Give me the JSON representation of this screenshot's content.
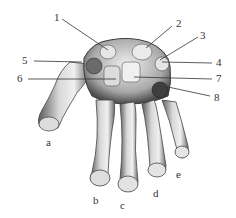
{
  "figure": {
    "number_labels": [
      {
        "id": "1",
        "x": 54,
        "y": 12,
        "lx1": 62,
        "ly1": 19,
        "lx2": 108,
        "ly2": 50
      },
      {
        "id": "2",
        "x": 176,
        "y": 18,
        "lx1": 172,
        "ly1": 26,
        "lx2": 146,
        "ly2": 48
      },
      {
        "id": "3",
        "x": 200,
        "y": 30,
        "lx1": 198,
        "ly1": 37,
        "lx2": 160,
        "ly2": 60
      },
      {
        "id": "4",
        "x": 216,
        "y": 57,
        "lx1": 212,
        "ly1": 63,
        "lx2": 162,
        "ly2": 62
      },
      {
        "id": "5",
        "x": 22,
        "y": 55,
        "lx1": 34,
        "ly1": 61,
        "lx2": 82,
        "ly2": 62
      },
      {
        "id": "6",
        "x": 17,
        "y": 73,
        "lx1": 28,
        "ly1": 79,
        "lx2": 116,
        "ly2": 79
      },
      {
        "id": "7",
        "x": 216,
        "y": 73,
        "lx1": 212,
        "ly1": 79,
        "lx2": 134,
        "ly2": 77
      },
      {
        "id": "8",
        "x": 214,
        "y": 92,
        "lx1": 210,
        "ly1": 96,
        "lx2": 168,
        "ly2": 87
      }
    ],
    "letter_labels": [
      {
        "id": "a",
        "x": 46,
        "y": 137
      },
      {
        "id": "b",
        "x": 93,
        "y": 195
      },
      {
        "id": "c",
        "x": 120,
        "y": 200
      },
      {
        "id": "d",
        "x": 153,
        "y": 188
      },
      {
        "id": "e",
        "x": 176,
        "y": 169
      }
    ],
    "colors": {
      "bone_light": "#e8e8e8",
      "bone_mid": "#b5b5b5",
      "bone_dark": "#4a4a4a",
      "line": "#333333"
    }
  }
}
